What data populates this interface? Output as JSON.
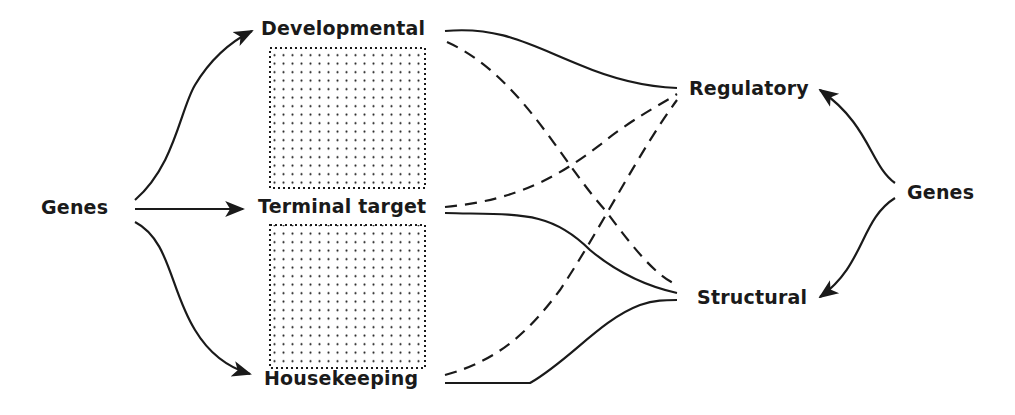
{
  "diagram": {
    "nodes": {
      "genes_left": "Genes",
      "developmental": "Developmental",
      "terminal_target": "Terminal target",
      "housekeeping": "Housekeeping",
      "regulatory": "Regulatory",
      "structural": "Structural",
      "genes_right": "Genes"
    },
    "edges": [
      {
        "from": "Genes (left)",
        "to": "Developmental",
        "style": "solid-arrow"
      },
      {
        "from": "Genes (left)",
        "to": "Terminal target",
        "style": "solid-arrow"
      },
      {
        "from": "Genes (left)",
        "to": "Housekeeping",
        "style": "solid-arrow"
      },
      {
        "from": "Genes (right)",
        "to": "Regulatory",
        "style": "solid-arrow"
      },
      {
        "from": "Genes (right)",
        "to": "Structural",
        "style": "solid-arrow"
      },
      {
        "from": "Developmental",
        "to": "Regulatory",
        "style": "solid"
      },
      {
        "from": "Developmental",
        "to": "Structural",
        "style": "dashed"
      },
      {
        "from": "Terminal target",
        "to": "Regulatory",
        "style": "dashed"
      },
      {
        "from": "Terminal target",
        "to": "Structural",
        "style": "solid"
      },
      {
        "from": "Housekeeping",
        "to": "Regulatory",
        "style": "dashed"
      },
      {
        "from": "Housekeeping",
        "to": "Structural",
        "style": "solid"
      }
    ],
    "shaded_regions": [
      {
        "between": [
          "Developmental",
          "Terminal target"
        ],
        "pattern": "dotted"
      },
      {
        "between": [
          "Terminal target",
          "Housekeeping"
        ],
        "pattern": "dotted"
      }
    ],
    "colors": {
      "ink": "#1a1a1a",
      "background": "#ffffff"
    }
  }
}
